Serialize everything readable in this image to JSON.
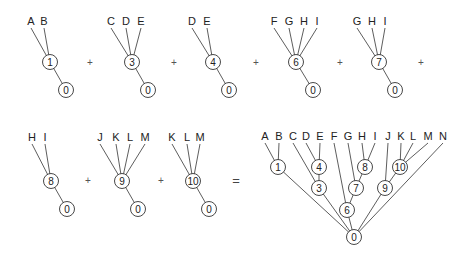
{
  "diagram": {
    "node_radius": 7.5,
    "colors": {
      "stroke": "#333333",
      "text": "#222222",
      "background": "#ffffff"
    },
    "components": [
      {
        "id": "c1",
        "leaves": [
          {
            "label": "A",
            "x": 31,
            "y": 21
          },
          {
            "label": "B",
            "x": 44,
            "y": 21
          }
        ],
        "mid": {
          "label": "1",
          "x": 50,
          "y": 62
        },
        "root": {
          "label": "0",
          "x": 66,
          "y": 90
        }
      },
      {
        "id": "c3",
        "leaves": [
          {
            "label": "C",
            "x": 111,
            "y": 21
          },
          {
            "label": "D",
            "x": 126,
            "y": 21
          },
          {
            "label": "E",
            "x": 141,
            "y": 21
          }
        ],
        "mid": {
          "label": "3",
          "x": 132,
          "y": 62
        },
        "root": {
          "label": "0",
          "x": 148,
          "y": 90
        }
      },
      {
        "id": "c4",
        "leaves": [
          {
            "label": "D",
            "x": 192,
            "y": 21
          },
          {
            "label": "E",
            "x": 207,
            "y": 21
          }
        ],
        "mid": {
          "label": "4",
          "x": 213,
          "y": 62
        },
        "root": {
          "label": "0",
          "x": 229,
          "y": 90
        }
      },
      {
        "id": "c6",
        "leaves": [
          {
            "label": "F",
            "x": 274,
            "y": 21
          },
          {
            "label": "G",
            "x": 289,
            "y": 21
          },
          {
            "label": "H",
            "x": 304,
            "y": 21
          },
          {
            "label": "I",
            "x": 317,
            "y": 21
          }
        ],
        "mid": {
          "label": "6",
          "x": 296,
          "y": 62
        },
        "root": {
          "label": "0",
          "x": 313,
          "y": 90
        }
      },
      {
        "id": "c7",
        "leaves": [
          {
            "label": "G",
            "x": 357,
            "y": 21
          },
          {
            "label": "H",
            "x": 372,
            "y": 21
          },
          {
            "label": "I",
            "x": 385,
            "y": 21
          }
        ],
        "mid": {
          "label": "7",
          "x": 379,
          "y": 62
        },
        "root": {
          "label": "0",
          "x": 395,
          "y": 90
        }
      },
      {
        "id": "c8",
        "leaves": [
          {
            "label": "H",
            "x": 32,
            "y": 137
          },
          {
            "label": "I",
            "x": 45,
            "y": 137
          }
        ],
        "mid": {
          "label": "8",
          "x": 51,
          "y": 181
        },
        "root": {
          "label": "0",
          "x": 67,
          "y": 209
        }
      },
      {
        "id": "c9",
        "leaves": [
          {
            "label": "J",
            "x": 100,
            "y": 137
          },
          {
            "label": "K",
            "x": 116,
            "y": 137
          },
          {
            "label": "L",
            "x": 130,
            "y": 137
          },
          {
            "label": "M",
            "x": 145,
            "y": 137
          }
        ],
        "mid": {
          "label": "9",
          "x": 122,
          "y": 181
        },
        "root": {
          "label": "0",
          "x": 138,
          "y": 209
        }
      },
      {
        "id": "c10",
        "leaves": [
          {
            "label": "K",
            "x": 172,
            "y": 137
          },
          {
            "label": "L",
            "x": 187,
            "y": 137
          },
          {
            "label": "M",
            "x": 200,
            "y": 137
          }
        ],
        "mid": {
          "label": "10",
          "x": 193,
          "y": 181
        },
        "root": {
          "label": "0",
          "x": 209,
          "y": 209
        }
      }
    ],
    "operators": [
      {
        "symbol": "+",
        "x": 90,
        "y": 66
      },
      {
        "symbol": "+",
        "x": 174,
        "y": 66
      },
      {
        "symbol": "+",
        "x": 256,
        "y": 66
      },
      {
        "symbol": "+",
        "x": 340,
        "y": 66
      },
      {
        "symbol": "+",
        "x": 421,
        "y": 66
      },
      {
        "symbol": "+",
        "x": 88,
        "y": 184
      },
      {
        "symbol": "+",
        "x": 161,
        "y": 184
      },
      {
        "symbol": "=",
        "x": 236,
        "y": 185
      }
    ],
    "result_tree": {
      "leaves": [
        {
          "label": "A",
          "x": 265,
          "y": 136
        },
        {
          "label": "B",
          "x": 279,
          "y": 136
        },
        {
          "label": "C",
          "x": 293,
          "y": 136
        },
        {
          "label": "D",
          "x": 306,
          "y": 136
        },
        {
          "label": "E",
          "x": 320,
          "y": 136
        },
        {
          "label": "F",
          "x": 334,
          "y": 136
        },
        {
          "label": "G",
          "x": 348,
          "y": 136
        },
        {
          "label": "H",
          "x": 362,
          "y": 136
        },
        {
          "label": "I",
          "x": 375,
          "y": 136
        },
        {
          "label": "J",
          "x": 388,
          "y": 136
        },
        {
          "label": "K",
          "x": 401,
          "y": 136
        },
        {
          "label": "L",
          "x": 413,
          "y": 136
        },
        {
          "label": "M",
          "x": 428,
          "y": 136
        },
        {
          "label": "N",
          "x": 443,
          "y": 136
        }
      ],
      "nodes": [
        {
          "label": "1",
          "x": 278,
          "y": 167
        },
        {
          "label": "4",
          "x": 319,
          "y": 167
        },
        {
          "label": "8",
          "x": 365,
          "y": 167
        },
        {
          "label": "10",
          "x": 400,
          "y": 167
        },
        {
          "label": "3",
          "x": 319,
          "y": 188
        },
        {
          "label": "7",
          "x": 356,
          "y": 188
        },
        {
          "label": "9",
          "x": 385,
          "y": 188
        },
        {
          "label": "6",
          "x": 347,
          "y": 210
        },
        {
          "label": "0",
          "x": 354,
          "y": 237
        }
      ],
      "edges": [
        [
          "A",
          "1"
        ],
        [
          "B",
          "1"
        ],
        [
          "D",
          "4"
        ],
        [
          "E",
          "4"
        ],
        [
          "C",
          "3"
        ],
        [
          "4",
          "3"
        ],
        [
          "H",
          "8"
        ],
        [
          "I",
          "8"
        ],
        [
          "G",
          "7"
        ],
        [
          "8",
          "7"
        ],
        [
          "F",
          "6"
        ],
        [
          "7",
          "6"
        ],
        [
          "K",
          "10"
        ],
        [
          "L",
          "10"
        ],
        [
          "M",
          "10"
        ],
        [
          "J",
          "9"
        ],
        [
          "10",
          "9"
        ],
        [
          "1",
          "0"
        ],
        [
          "3",
          "0"
        ],
        [
          "6",
          "0"
        ],
        [
          "9",
          "0"
        ],
        [
          "N",
          "0"
        ]
      ]
    }
  }
}
